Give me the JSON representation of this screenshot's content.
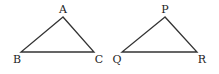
{
  "diagram": {
    "triangles": [
      {
        "name": "ABC",
        "vertices": [
          {
            "label": "A",
            "x": 63,
            "y": 17,
            "lx": 63,
            "ly": 13,
            "anchor": "middle"
          },
          {
            "label": "B",
            "x": 21,
            "y": 52,
            "lx": 17,
            "ly": 63,
            "anchor": "middle"
          },
          {
            "label": "C",
            "x": 94,
            "y": 52,
            "lx": 99,
            "ly": 63,
            "anchor": "middle"
          }
        ]
      },
      {
        "name": "PQR",
        "vertices": [
          {
            "label": "P",
            "x": 165,
            "y": 17,
            "lx": 165,
            "ly": 13,
            "anchor": "middle"
          },
          {
            "label": "Q",
            "x": 122,
            "y": 52,
            "lx": 117,
            "ly": 63,
            "anchor": "middle"
          },
          {
            "label": "R",
            "x": 197,
            "y": 52,
            "lx": 202,
            "ly": 63,
            "anchor": "middle"
          }
        ]
      }
    ]
  }
}
